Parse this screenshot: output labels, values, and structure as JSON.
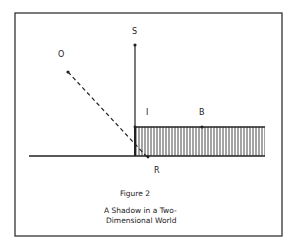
{
  "figure": {
    "title": "Figure 2",
    "caption_line1": "A  Shadow in a Two-",
    "caption_line2": "Dimensional World"
  },
  "points": {
    "S": "S",
    "O": "O",
    "I": "I",
    "B": "B",
    "R": "R"
  },
  "colors": {
    "ink": "#222222",
    "border": "#333333",
    "background": "#ffffff"
  }
}
